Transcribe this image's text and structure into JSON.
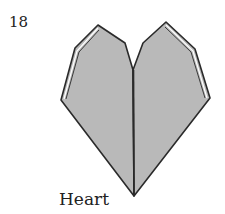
{
  "step": {
    "number": "18"
  },
  "caption": {
    "label": "Heart"
  },
  "figure": {
    "colors": {
      "fill": "#b9b9b9",
      "outline": "#2a2a2a",
      "edge_highlight": "#ffffff",
      "background": "#ffffff"
    }
  }
}
